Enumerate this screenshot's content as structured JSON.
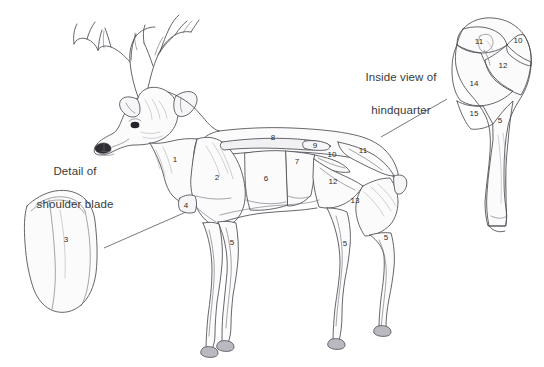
{
  "figure": {
    "background_color": "#ffffff",
    "line_color": "#4a4a52",
    "text_color": "#3a3a3a",
    "hoof_color": "#b9b9bf"
  },
  "callouts": {
    "shoulder": {
      "label": "Detail of\nshoulder blade",
      "line1": "Detail of",
      "line2": "shoulder blade"
    },
    "hindquarter": {
      "label": "Inside view of\nhindquarter",
      "line1": "Inside view of",
      "line2": "hindquarter"
    }
  },
  "body_labels": [
    {
      "id": "b1",
      "text": "1",
      "x": 175,
      "y": 159
    },
    {
      "id": "b2",
      "text": "2",
      "x": 217,
      "y": 177
    },
    {
      "id": "b4",
      "text": "4",
      "x": 186,
      "y": 205
    },
    {
      "id": "b5a",
      "text": "5",
      "x": 232,
      "y": 242
    },
    {
      "id": "b6",
      "text": "6",
      "x": 266,
      "y": 178
    },
    {
      "id": "b7",
      "text": "7",
      "x": 297,
      "y": 161
    },
    {
      "id": "b8",
      "text": "8",
      "x": 273,
      "y": 137
    },
    {
      "id": "b9",
      "text": "9",
      "x": 315,
      "y": 145
    },
    {
      "id": "b10",
      "text": "10",
      "x": 332,
      "y": 154
    },
    {
      "id": "b11",
      "text": "11",
      "x": 363,
      "y": 150
    },
    {
      "id": "b12",
      "text": "12",
      "x": 333,
      "y": 181
    },
    {
      "id": "b13",
      "text": "13",
      "x": 355,
      "y": 200
    },
    {
      "id": "b5b",
      "text": "5",
      "x": 345,
      "y": 243
    },
    {
      "id": "b5c",
      "text": "5",
      "x": 386,
      "y": 237
    }
  ],
  "shoulder_detail_labels": [
    {
      "id": "s3",
      "text": "3",
      "x": 66,
      "y": 239
    }
  ],
  "hindquarter_detail_labels": [
    {
      "id": "h11",
      "text": "11",
      "x": 479,
      "y": 41
    },
    {
      "id": "h10",
      "text": "10",
      "x": 518,
      "y": 40
    },
    {
      "id": "h12",
      "text": "12",
      "x": 503,
      "y": 65
    },
    {
      "id": "h14",
      "text": "14",
      "x": 474,
      "y": 83
    },
    {
      "id": "h15",
      "text": "15",
      "x": 474,
      "y": 113
    },
    {
      "id": "h5",
      "text": "5",
      "x": 500,
      "y": 120
    }
  ],
  "legend_numbers_present": [
    "1",
    "2",
    "3",
    "4",
    "5",
    "6",
    "7",
    "8",
    "9",
    "10",
    "11",
    "12",
    "13",
    "14",
    "15"
  ]
}
